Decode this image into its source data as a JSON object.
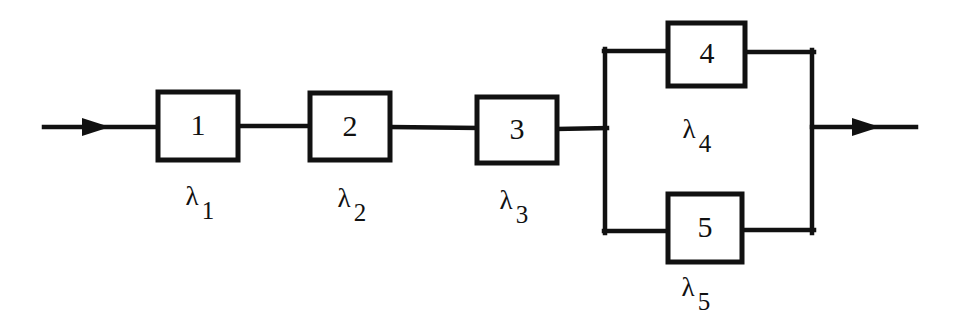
{
  "figure": {
    "background_color": "#ffffff",
    "line_color": "#111111",
    "width": 960,
    "height": 324
  },
  "blocks": [
    {
      "id": "block-1",
      "number": "1",
      "label_lambda": "λ",
      "label_subscript": "1",
      "x": 158,
      "y": 92,
      "w": 80,
      "h": 68,
      "cx": 198,
      "cy": 126,
      "label_x": 192,
      "label_y": 205,
      "arrangement": "series"
    },
    {
      "id": "block-2",
      "number": "2",
      "label_lambda": "λ",
      "label_subscript": "2",
      "x": 310,
      "y": 93,
      "w": 80,
      "h": 67,
      "cx": 350,
      "cy": 126,
      "label_x": 344,
      "label_y": 207,
      "arrangement": "series"
    },
    {
      "id": "block-3",
      "number": "3",
      "label_lambda": "λ",
      "label_subscript": "3",
      "x": 477,
      "y": 97,
      "w": 80,
      "h": 66,
      "cx": 517,
      "cy": 130,
      "label_x": 506,
      "label_y": 209,
      "arrangement": "series"
    },
    {
      "id": "block-4",
      "number": "4",
      "label_lambda": "λ",
      "label_subscript": "4",
      "x": 668,
      "y": 23,
      "w": 77,
      "h": 63,
      "cx": 706,
      "cy": 54,
      "label_x": 689,
      "label_y": 138,
      "arrangement": "parallel-top"
    },
    {
      "id": "block-5",
      "number": "5",
      "label_lambda": "λ",
      "label_subscript": "5",
      "x": 668,
      "y": 194,
      "w": 74,
      "h": 68,
      "cx": 705,
      "cy": 228,
      "label_x": 688,
      "label_y": 296,
      "arrangement": "parallel-bottom"
    }
  ],
  "wires": {
    "input_arrow": {
      "x1": 44,
      "y1": 127,
      "x2": 158,
      "y2": 127,
      "head_x": 104,
      "direction": "right"
    },
    "series_1_to_2": {
      "x1": 238,
      "y1": 126,
      "x2": 310,
      "y2": 126
    },
    "series_2_to_3": {
      "x1": 390,
      "y1": 127,
      "x2": 477,
      "y2": 128
    },
    "series_3_to_rail": {
      "x1": 557,
      "y1": 129,
      "x2": 605,
      "y2": 128
    },
    "left_rail": {
      "x": 605,
      "y1": 51,
      "y2": 231
    },
    "right_rail": {
      "x": 812,
      "y1": 52,
      "y2": 231
    },
    "top_branch_in": {
      "x1": 605,
      "y1": 51,
      "x2": 668,
      "y2": 51
    },
    "top_branch_out": {
      "x1": 745,
      "y1": 52,
      "x2": 812,
      "y2": 52
    },
    "bottom_branch_in": {
      "x1": 605,
      "y1": 231,
      "x2": 668,
      "y2": 231
    },
    "bottom_branch_out": {
      "x1": 742,
      "y1": 230,
      "x2": 812,
      "y2": 230
    },
    "output_arrow": {
      "x1": 812,
      "y1": 127,
      "x2": 916,
      "y2": 127,
      "head_x": 872,
      "direction": "right"
    }
  }
}
